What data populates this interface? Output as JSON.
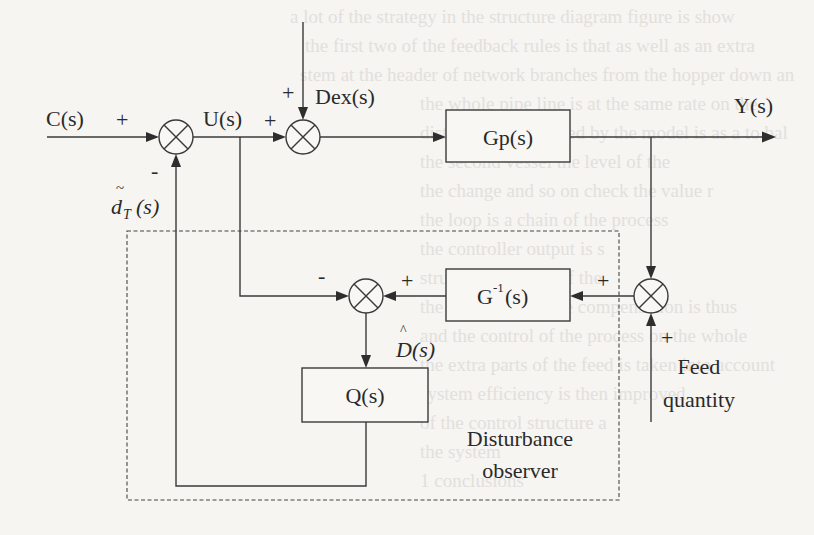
{
  "diagram": {
    "type": "block-diagram",
    "signals": {
      "input": "C(s)",
      "control": "U(s)",
      "external_disturbance": "Dex(s)",
      "output": "Y(s)",
      "estimated_disturbance": "D(s)",
      "estimated_disturbance_accent": "^",
      "compensation": "d",
      "compensation_subscript": "T",
      "compensation_suffix": "(s)",
      "compensation_accent": "~",
      "feed": [
        "Feed",
        "quantity"
      ]
    },
    "blocks": {
      "plant": "Gp(s)",
      "inverse_model_base": "G",
      "inverse_model_sup": "-1",
      "inverse_model_suffix": "(s)",
      "filter": "Q(s)"
    },
    "signs": {
      "sum1_input": "+",
      "sum1_feedback": "-",
      "sum2_control": "+",
      "sum2_disturbance": "+",
      "sum3_control": "-",
      "sum3_model": "+",
      "sum4_output": "+",
      "sum4_feed": "+"
    },
    "group": {
      "label_line1": "Disturbance",
      "label_line2": "observer"
    },
    "colors": {
      "line": "#3a3a3a",
      "text": "#2a2a2a",
      "background": "#f6f5f2"
    }
  }
}
